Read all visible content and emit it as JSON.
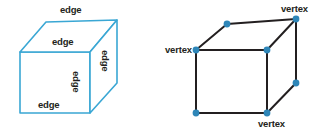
{
  "figure": {
    "background_color": "#ffffff",
    "width": 330,
    "height": 132
  },
  "colors": {
    "cube_outline_blue": "#3aa7d4",
    "cube_outline_dark": "#231f20",
    "vertex_dot_blue": "#2e86b8",
    "label_text": "#231f20"
  },
  "left_figure": {
    "name": "edges-cube",
    "shape": "cube",
    "outline_color": "#3aa7d4",
    "labels": [
      {
        "id": "edge-top-back",
        "text": "edge",
        "x": 60,
        "y": 5,
        "rotation": 0
      },
      {
        "id": "edge-top-front",
        "text": "edge",
        "x": 52,
        "y": 37,
        "rotation": 0
      },
      {
        "id": "edge-right-side",
        "text": "edge",
        "x": 104,
        "y": 51,
        "rotation": 90
      },
      {
        "id": "edge-front-vert",
        "text": "edge",
        "x": 75,
        "y": 72,
        "rotation": 90
      },
      {
        "id": "edge-bottom",
        "text": "edge",
        "x": 38,
        "y": 100,
        "rotation": 0
      }
    ],
    "vertices": {
      "front_top_left": [
        20,
        52
      ],
      "front_top_right": [
        90,
        52
      ],
      "front_bottom_left": [
        20,
        113
      ],
      "front_bottom_right": [
        90,
        113
      ],
      "back_top_left": [
        46,
        22
      ],
      "back_top_right": [
        117,
        20
      ],
      "back_bottom_right": [
        117,
        83
      ]
    }
  },
  "right_figure": {
    "name": "vertices-cube",
    "shape": "cube",
    "outline_color": "#231f20",
    "dot_color": "#2e86b8",
    "labels": [
      {
        "id": "vertex-top-right",
        "text": "vertex",
        "x": 281,
        "y": 4
      },
      {
        "id": "vertex-front-left",
        "text": "vertex",
        "x": 165,
        "y": 45
      },
      {
        "id": "vertex-bottom-front",
        "text": "vertex",
        "x": 258,
        "y": 119
      }
    ],
    "vertices": {
      "front_top_left": [
        196,
        50
      ],
      "front_top_right": [
        267,
        50
      ],
      "front_bottom_left": [
        196,
        113
      ],
      "front_bottom_right": [
        267,
        113
      ],
      "back_top_left": [
        227,
        24
      ],
      "back_top_right": [
        296,
        19
      ],
      "back_bottom_right": [
        296,
        83
      ]
    },
    "dots": [
      [
        227,
        24
      ],
      [
        296,
        19
      ],
      [
        196,
        50
      ],
      [
        267,
        50
      ],
      [
        296,
        83
      ],
      [
        196,
        113
      ],
      [
        267,
        113
      ]
    ]
  }
}
